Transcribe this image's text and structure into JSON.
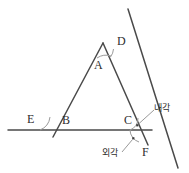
{
  "figure": {
    "background_color": "#ffffff",
    "line_color": "#4a4a4a",
    "arc_color": "#9a9a9a",
    "label_color": "#2e2e2e",
    "width": 189,
    "height": 173
  },
  "labels": {
    "apex_inner": "A",
    "apex_outer": "D",
    "left_outer": "E",
    "left_inner": "B",
    "right_inner": "C",
    "right_lower": "F",
    "interior_angle": "내각",
    "exterior_angle": "외각"
  },
  "geometry": {
    "apex": {
      "x": 103,
      "y": 43
    },
    "left_vertex": {
      "x": 57,
      "y": 129
    },
    "right_vertex": {
      "x": 142,
      "y": 129
    },
    "baseline": {
      "x1": 8,
      "y1": 130,
      "x2": 152,
      "y2": 130
    },
    "transversal": {
      "x1": 128,
      "y1": 9,
      "x2": 178,
      "y2": 168
    }
  },
  "annotations": {
    "interior_angle_marker": {
      "x": 137,
      "y": 125
    },
    "exterior_angle_marker": {
      "x": 133,
      "y": 138
    }
  }
}
